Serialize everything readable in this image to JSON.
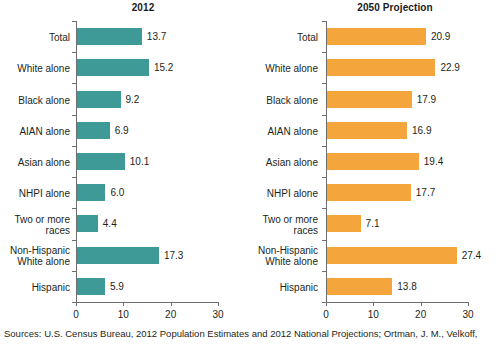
{
  "chart_data": {
    "type": "bar",
    "orientation": "horizontal",
    "title": "",
    "xlabel": "",
    "ylabel": "",
    "xlim": [
      0,
      30
    ],
    "xticks": [
      0,
      10,
      20,
      30
    ],
    "grid": false,
    "legend": "none",
    "categories": [
      "Total",
      "White alone",
      "Black alone",
      "AIAN alone",
      "Asian alone",
      "NHPI alone",
      "Two or more\nraces",
      "Non-Hispanic\nWhite alone",
      "Hispanic"
    ],
    "panels": [
      {
        "title": "2012",
        "color": "#3e9a97",
        "values": [
          13.7,
          15.2,
          9.2,
          6.9,
          10.1,
          6.0,
          4.4,
          17.3,
          5.9
        ],
        "value_labels": [
          "13.7",
          "15.2",
          "9.2",
          "6.9",
          "10.1",
          "6.0",
          "4.4",
          "17.3",
          "5.9"
        ]
      },
      {
        "title": "2050 Projection",
        "color": "#f4a63c",
        "values": [
          20.9,
          22.9,
          17.9,
          16.9,
          19.4,
          17.7,
          7.1,
          27.4,
          13.8
        ],
        "value_labels": [
          "20.9",
          "22.9",
          "17.9",
          "16.9",
          "19.4",
          "17.7",
          "7.1",
          "27.4",
          "13.8"
        ]
      }
    ],
    "xtick_labels": [
      "0",
      "10",
      "20",
      "30"
    ],
    "sources": "Sources: U.S. Census Bureau, 2012 Population Estimates and 2012 National Projections; Ortman, J. M., Velkoff,"
  }
}
